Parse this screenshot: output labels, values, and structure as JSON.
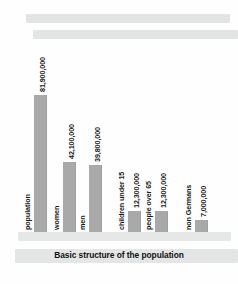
{
  "figure": {
    "caption": "Basic structure of the population",
    "redactions": [
      {
        "name": "redacted-heading-line-1"
      },
      {
        "name": "redacted-heading-line-2"
      }
    ]
  },
  "chart_data": {
    "type": "bar",
    "title": "Basic structure of the population",
    "xlabel": "",
    "ylabel": "",
    "ylim": [
      0,
      81900000
    ],
    "grid": false,
    "legend": "none",
    "orientation": "vertical",
    "bar_color": "#a9a9a9",
    "categories": [
      "population",
      "women",
      "men",
      "children under 15",
      "people over 65",
      "non Germans"
    ],
    "values": [
      81900000,
      42100000,
      39800000,
      12300000,
      12300000,
      7000000
    ],
    "value_labels": [
      "81,900,000",
      "42,100,000",
      "39,800,000",
      "12,300,000",
      "12,300,000",
      "7,000,000"
    ]
  }
}
